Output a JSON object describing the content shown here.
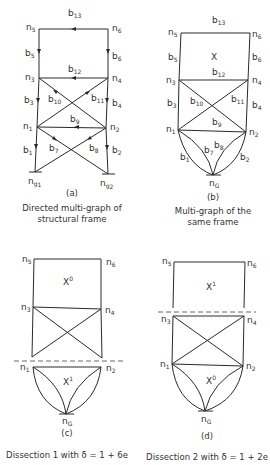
{
  "figure": {
    "panels": [
      {
        "id": "a",
        "tag": "(a)",
        "caption_line1": "Directed multi-graph of",
        "caption_line2": "structural frame",
        "nodes": [
          "n5",
          "n6",
          "n3",
          "n4",
          "n1",
          "n2",
          "ng1",
          "ng2"
        ],
        "branches": [
          "b1",
          "b2",
          "b3",
          "b4",
          "b5",
          "b6",
          "b7",
          "b8",
          "b9",
          "b10",
          "b11",
          "b12",
          "b13"
        ]
      },
      {
        "id": "b",
        "tag": "(b)",
        "caption_line1": "Multi-graph of the",
        "caption_line2": "same frame",
        "region_label": "X",
        "nodes": [
          "n5",
          "n6",
          "n3",
          "n4",
          "n1",
          "n2",
          "nG"
        ],
        "branches": [
          "b1",
          "b2",
          "b3",
          "b4",
          "b5",
          "b6",
          "b7",
          "b8",
          "b9",
          "b10",
          "b11",
          "b12",
          "b13"
        ]
      },
      {
        "id": "c",
        "tag": "(c)",
        "caption": "Dissection 1 with δ = 1 + 6e",
        "upper_label": "X",
        "upper_sup": "0",
        "lower_label": "X",
        "lower_sup": "1",
        "nodes": [
          "n5",
          "n6",
          "n3",
          "n4",
          "n1",
          "n2",
          "nG"
        ]
      },
      {
        "id": "d",
        "tag": "(d)",
        "caption": "Dissection 2 with δ = 1 + 2e",
        "upper_label": "X",
        "upper_sup": "1",
        "lower_label": "X",
        "lower_sup": "0",
        "nodes": [
          "n5",
          "n6",
          "n3",
          "n4",
          "n1",
          "n2",
          "nG"
        ]
      }
    ],
    "labels": {
      "n": "n",
      "b": "b",
      "g": "g",
      "G": "G",
      "s1": "1",
      "s2": "2",
      "s3": "3",
      "s4": "4",
      "s5": "5",
      "s6": "6",
      "s7": "7",
      "s8": "8",
      "s9": "9",
      "s10": "10",
      "s11": "11",
      "s12": "12",
      "s13": "13"
    }
  }
}
